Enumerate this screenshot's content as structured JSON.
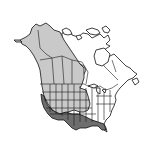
{
  "map": {
    "title": "",
    "region": "North America",
    "type": "species-range-map",
    "colors": {
      "background": "#ffffff",
      "land_absent": "#ffffff",
      "range_light": "#c9c9c9",
      "range_dark": "#6e6e6e",
      "borders": "#1a1a1a"
    },
    "legend": [
      {
        "key": "range_light",
        "color": "#c9c9c9"
      },
      {
        "key": "range_dark",
        "color": "#6e6e6e"
      },
      {
        "key": "absent",
        "color": "#ffffff"
      }
    ]
  }
}
